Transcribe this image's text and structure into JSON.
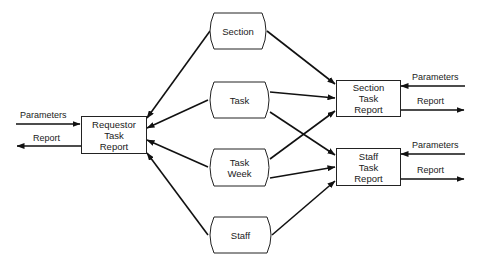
{
  "diagram": {
    "type": "data-flow",
    "reports": {
      "requestor": {
        "lines": [
          "Requestor",
          "Task",
          "Report"
        ]
      },
      "section": {
        "lines": [
          "Section",
          "Task",
          "Report"
        ]
      },
      "staff": {
        "lines": [
          "Staff",
          "Task",
          "Report"
        ]
      }
    },
    "files": {
      "section": {
        "lines": [
          "Section"
        ]
      },
      "task": {
        "lines": [
          "Task"
        ]
      },
      "task_week": {
        "lines": [
          "Task",
          "Week"
        ]
      },
      "staff": {
        "lines": [
          "Staff"
        ]
      }
    },
    "io_labels": {
      "left_parameters": "Parameters",
      "left_report": "Report",
      "section_parameters": "Parameters",
      "section_report": "Report",
      "staff_parameters": "Parameters",
      "staff_report": "Report"
    },
    "edges": [
      {
        "from": "Section",
        "to": "Requestor Task Report"
      },
      {
        "from": "Task",
        "to": "Requestor Task Report"
      },
      {
        "from": "Task Week",
        "to": "Requestor Task Report"
      },
      {
        "from": "Staff",
        "to": "Requestor Task Report"
      },
      {
        "from": "Section",
        "to": "Section Task Report"
      },
      {
        "from": "Task",
        "to": "Section Task Report"
      },
      {
        "from": "Task Week",
        "to": "Section Task Report"
      },
      {
        "from": "Task",
        "to": "Staff Task Report"
      },
      {
        "from": "Task Week",
        "to": "Staff Task Report"
      },
      {
        "from": "Staff",
        "to": "Staff Task Report"
      },
      {
        "from": "Parameters (external)",
        "to": "Requestor Task Report"
      },
      {
        "from": "Requestor Task Report",
        "to": "Report (external)"
      },
      {
        "from": "Parameters (external)",
        "to": "Section Task Report"
      },
      {
        "from": "Section Task Report",
        "to": "Report (external)"
      },
      {
        "from": "Parameters (external)",
        "to": "Staff Task Report"
      },
      {
        "from": "Staff Task Report",
        "to": "Report (external)"
      }
    ]
  }
}
